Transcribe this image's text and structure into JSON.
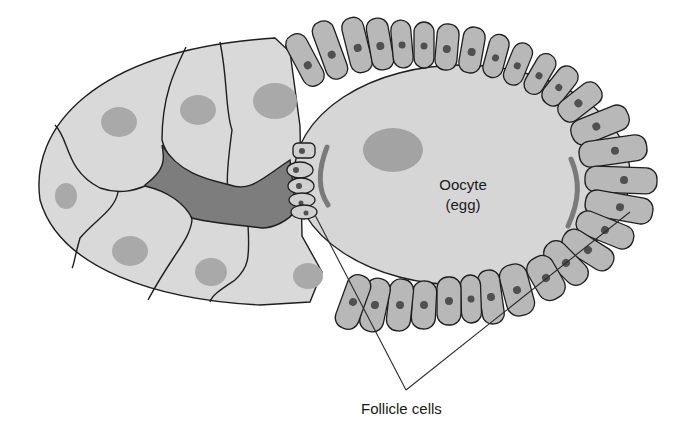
{
  "diagram": {
    "labels": {
      "oocyte_line1": "Oocyte",
      "oocyte_line2": "(egg)",
      "follicle_cells": "Follicle cells"
    },
    "structures": [
      "nurse cells (with nuclei)",
      "cytoplasmic canal (dark region)",
      "oocyte with nucleus",
      "follicular epithelium (follicle cells, each with dark nucleus)",
      "border cells cluster at anterior of oocyte"
    ],
    "colors": {
      "background": "#ffffff",
      "nurse_cell": "#d9d9d9",
      "nurse_nucleus": "#a9a9a9",
      "canal": "#7d7d7d",
      "oocyte": "#d6d6d6",
      "follicle_cell": "#b8b8b8",
      "follicle_nucleus": "#505050",
      "outline": "#1e1e1e"
    }
  }
}
